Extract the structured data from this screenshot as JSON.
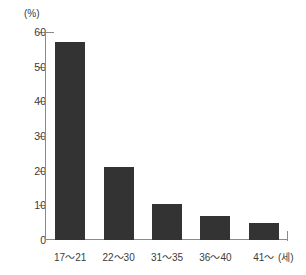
{
  "chart_data": {
    "type": "bar",
    "title": "",
    "subtitle": "",
    "categories": [
      "17～21",
      "22～30",
      "31～35",
      "36～40",
      "41～"
    ],
    "values": [
      57,
      21,
      10.5,
      7,
      5
    ],
    "xlabel": "(세)",
    "ylabel": "(%)",
    "ylim": [
      0,
      60
    ],
    "yticks": [
      0,
      10,
      20,
      30,
      40,
      50,
      60
    ],
    "ytick_labels": [
      "0",
      "10",
      "20",
      "30",
      "40",
      "50",
      "60"
    ],
    "grid": false,
    "legend": null,
    "bar_color": "#333333",
    "axis_color": "#8a8a8a",
    "text_color": "#3b3b3b",
    "annotations": []
  }
}
